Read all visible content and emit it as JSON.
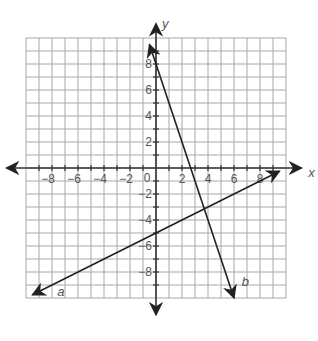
{
  "diagram": {
    "title": "",
    "x_axis_label": "x",
    "y_axis_label": "y",
    "origin_label": "0",
    "x_ticks": [
      "-8",
      "-6",
      "-4",
      "-2",
      "2",
      "4",
      "6",
      "8"
    ],
    "y_ticks": [
      "8",
      "6",
      "4",
      "2",
      "-2",
      "-4",
      "-6",
      "-8"
    ],
    "grid": {
      "xmin": -10,
      "xmax": 10,
      "ymin": -10,
      "ymax": 10,
      "step": 1
    },
    "lines": [
      {
        "label": "a",
        "equation": "y = 0.5x - 5",
        "from": [
          -9.5,
          -9.75
        ],
        "to": [
          9.5,
          -0.25
        ]
      },
      {
        "label": "b",
        "equation": "y = -3x + 8",
        "from": [
          -0.5,
          9.5
        ],
        "to": [
          6,
          -10
        ]
      }
    ],
    "colors": {
      "grid": "#a8a8a8",
      "axis": "#333333",
      "line": "#222222",
      "text": "#555555"
    }
  }
}
